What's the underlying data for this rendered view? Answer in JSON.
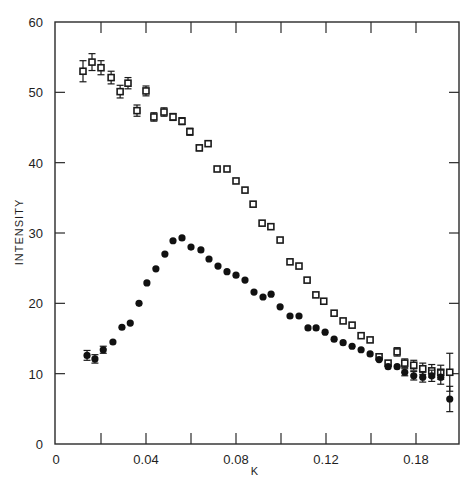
{
  "chart_data": {
    "type": "scatter",
    "title": "",
    "xlabel": "K",
    "ylabel": "INTENSITY",
    "xlim": [
      0,
      0.18
    ],
    "ylim": [
      0,
      60
    ],
    "grid": false,
    "legend": null,
    "x_ticks": [
      {
        "value": 0,
        "label": "0"
      },
      {
        "value": 0.02,
        "label": ""
      },
      {
        "value": 0.04,
        "label": "0.04"
      },
      {
        "value": 0.06,
        "label": ""
      },
      {
        "value": 0.08,
        "label": "0.08"
      },
      {
        "value": 0.1,
        "label": ""
      },
      {
        "value": 0.12,
        "label": "0.12"
      },
      {
        "value": 0.14,
        "label": ""
      },
      {
        "value": 0.16,
        "label": "0.18"
      }
    ],
    "y_ticks": [
      {
        "value": 0,
        "label": "0"
      },
      {
        "value": 10,
        "label": "10"
      },
      {
        "value": 20,
        "label": "20"
      },
      {
        "value": 30,
        "label": "30"
      },
      {
        "value": 40,
        "label": "40"
      },
      {
        "value": 50,
        "label": "50"
      },
      {
        "value": 60,
        "label": "60"
      }
    ],
    "series": [
      {
        "name": "open squares",
        "marker": "square-open",
        "points": [
          {
            "x": 0.012,
            "y": 53.0,
            "err": 1.5
          },
          {
            "x": 0.016,
            "y": 54.3,
            "err": 1.2
          },
          {
            "x": 0.02,
            "y": 53.5,
            "err": 1.0
          },
          {
            "x": 0.0245,
            "y": 52.1,
            "err": 0.9
          },
          {
            "x": 0.0285,
            "y": 50.1,
            "err": 0.9
          },
          {
            "x": 0.032,
            "y": 51.3,
            "err": 0.8
          },
          {
            "x": 0.036,
            "y": 47.4,
            "err": 0.8
          },
          {
            "x": 0.04,
            "y": 50.2,
            "err": 0.7
          },
          {
            "x": 0.0435,
            "y": 46.5,
            "err": 0.6
          },
          {
            "x": 0.048,
            "y": 47.2,
            "err": 0.6
          },
          {
            "x": 0.052,
            "y": 46.5,
            "err": 0.5
          },
          {
            "x": 0.056,
            "y": 45.9,
            "err": 0.5
          },
          {
            "x": 0.0595,
            "y": 44.4,
            "err": 0.5
          },
          {
            "x": 0.0637,
            "y": 42.1,
            "err": 0.4
          },
          {
            "x": 0.0676,
            "y": 42.7,
            "err": 0
          },
          {
            "x": 0.0716,
            "y": 39.1,
            "err": 0
          },
          {
            "x": 0.076,
            "y": 39.1,
            "err": 0
          },
          {
            "x": 0.08,
            "y": 37.4,
            "err": 0
          },
          {
            "x": 0.084,
            "y": 36.1,
            "err": 0
          },
          {
            "x": 0.0876,
            "y": 34.1,
            "err": 0
          },
          {
            "x": 0.0916,
            "y": 31.4,
            "err": 0
          },
          {
            "x": 0.0955,
            "y": 30.9,
            "err": 0
          },
          {
            "x": 0.0996,
            "y": 29.0,
            "err": 0
          },
          {
            "x": 0.104,
            "y": 25.9,
            "err": 0
          },
          {
            "x": 0.108,
            "y": 25.3,
            "err": 0
          },
          {
            "x": 0.1116,
            "y": 23.3,
            "err": 0
          },
          {
            "x": 0.1155,
            "y": 21.2,
            "err": 0
          },
          {
            "x": 0.119,
            "y": 20.3,
            "err": 0
          },
          {
            "x": 0.1236,
            "y": 18.6,
            "err": 0
          },
          {
            "x": 0.1276,
            "y": 17.5,
            "err": 0
          },
          {
            "x": 0.1316,
            "y": 16.9,
            "err": 0
          },
          {
            "x": 0.1356,
            "y": 15.4,
            "err": 0
          },
          {
            "x": 0.1396,
            "y": 14.8,
            "err": 0
          },
          {
            "x": 0.1436,
            "y": 12.4,
            "err": 0
          },
          {
            "x": 0.1476,
            "y": 11.5,
            "err": 0
          },
          {
            "x": 0.1516,
            "y": 13.1,
            "err": 0.6
          },
          {
            "x": 0.155,
            "y": 11.5,
            "err": 0.6
          },
          {
            "x": 0.159,
            "y": 11.2,
            "err": 0.7
          },
          {
            "x": 0.163,
            "y": 10.7,
            "err": 0.8
          },
          {
            "x": 0.167,
            "y": 10.4,
            "err": 0.9
          },
          {
            "x": 0.171,
            "y": 10.2,
            "err": 1.0
          },
          {
            "x": 0.175,
            "y": 10.2,
            "err": 2.7
          }
        ]
      },
      {
        "name": "filled circles",
        "marker": "circle-filled",
        "points": [
          {
            "x": 0.0138,
            "y": 12.6,
            "err": 0.7
          },
          {
            "x": 0.0173,
            "y": 12.1,
            "err": 0.6
          },
          {
            "x": 0.021,
            "y": 13.4,
            "err": 0.5
          },
          {
            "x": 0.0253,
            "y": 14.5,
            "err": 0
          },
          {
            "x": 0.0293,
            "y": 16.6,
            "err": 0
          },
          {
            "x": 0.033,
            "y": 17.2,
            "err": 0
          },
          {
            "x": 0.0369,
            "y": 20.0,
            "err": 0
          },
          {
            "x": 0.0404,
            "y": 22.9,
            "err": 0
          },
          {
            "x": 0.0444,
            "y": 24.9,
            "err": 0
          },
          {
            "x": 0.0484,
            "y": 27.0,
            "err": 0
          },
          {
            "x": 0.052,
            "y": 28.9,
            "err": 0
          },
          {
            "x": 0.056,
            "y": 29.3,
            "err": 0
          },
          {
            "x": 0.06,
            "y": 28.0,
            "err": 0
          },
          {
            "x": 0.0644,
            "y": 27.6,
            "err": 0
          },
          {
            "x": 0.068,
            "y": 26.3,
            "err": 0
          },
          {
            "x": 0.072,
            "y": 25.3,
            "err": 0
          },
          {
            "x": 0.076,
            "y": 24.5,
            "err": 0
          },
          {
            "x": 0.08,
            "y": 24.0,
            "err": 0
          },
          {
            "x": 0.084,
            "y": 23.3,
            "err": 0
          },
          {
            "x": 0.088,
            "y": 21.6,
            "err": 0
          },
          {
            "x": 0.092,
            "y": 20.9,
            "err": 0
          },
          {
            "x": 0.0956,
            "y": 21.3,
            "err": 0
          },
          {
            "x": 0.0996,
            "y": 19.5,
            "err": 0
          },
          {
            "x": 0.104,
            "y": 18.2,
            "err": 0
          },
          {
            "x": 0.108,
            "y": 18.2,
            "err": 0
          },
          {
            "x": 0.112,
            "y": 16.5,
            "err": 0
          },
          {
            "x": 0.1156,
            "y": 16.5,
            "err": 0
          },
          {
            "x": 0.1196,
            "y": 15.9,
            "err": 0
          },
          {
            "x": 0.1236,
            "y": 14.9,
            "err": 0
          },
          {
            "x": 0.1276,
            "y": 14.4,
            "err": 0
          },
          {
            "x": 0.1316,
            "y": 13.9,
            "err": 0
          },
          {
            "x": 0.1356,
            "y": 13.4,
            "err": 0
          },
          {
            "x": 0.1396,
            "y": 12.8,
            "err": 0
          },
          {
            "x": 0.1436,
            "y": 12.0,
            "err": 0
          },
          {
            "x": 0.1476,
            "y": 11.0,
            "err": 0
          },
          {
            "x": 0.1516,
            "y": 11.0,
            "err": 0
          },
          {
            "x": 0.155,
            "y": 10.2,
            "err": 0.5
          },
          {
            "x": 0.159,
            "y": 9.7,
            "err": 0.6
          },
          {
            "x": 0.163,
            "y": 9.5,
            "err": 0.7
          },
          {
            "x": 0.167,
            "y": 9.7,
            "err": 0.8
          },
          {
            "x": 0.171,
            "y": 9.5,
            "err": 1.0
          },
          {
            "x": 0.175,
            "y": 6.4,
            "err": 1.8
          }
        ]
      }
    ]
  },
  "colors": {
    "axis": "#2a2a2a",
    "marker": "#111111",
    "background": "#ffffff"
  }
}
